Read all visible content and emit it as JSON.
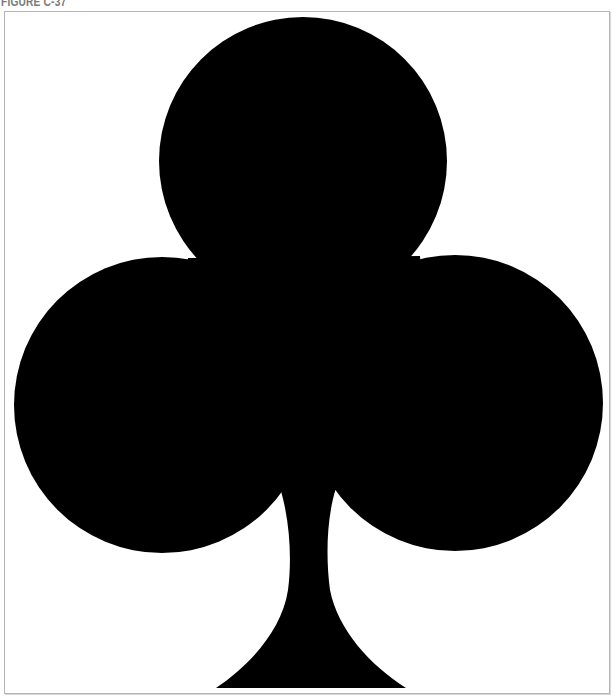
{
  "figure": {
    "caption": "FIGURE C-37",
    "fill_color": "#000000",
    "background_color": "#ffffff",
    "border_color": "#b5b5b5",
    "caption_color": "#7a7a7a"
  }
}
